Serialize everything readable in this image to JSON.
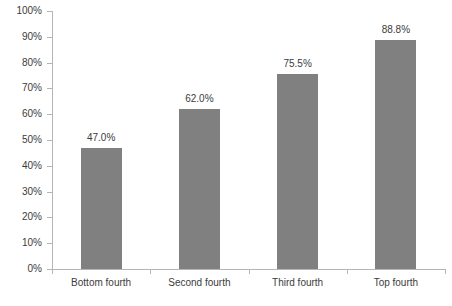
{
  "chart_data": {
    "type": "bar",
    "title": "",
    "subtitle": "",
    "xlabel": "",
    "ylabel": "",
    "categories": [
      "Bottom fourth",
      "Second fourth",
      "Third fourth",
      "Top fourth"
    ],
    "values": [
      47.0,
      62.0,
      75.5,
      88.8
    ],
    "data_labels": [
      "47.0%",
      "62.0%",
      "75.5%",
      "88.8%"
    ],
    "ylim": [
      0,
      100
    ],
    "ytick_step": 10,
    "ytick_labels": [
      "0%",
      "10%",
      "20%",
      "30%",
      "40%",
      "50%",
      "60%",
      "70%",
      "80%",
      "90%",
      "100%"
    ],
    "grid": false,
    "legend": false,
    "legend_position": "none",
    "bar_color": "#808080",
    "axis_color": "#b5b5b5",
    "text_color": "#3b3b3b",
    "background_color": "#ffffff"
  }
}
